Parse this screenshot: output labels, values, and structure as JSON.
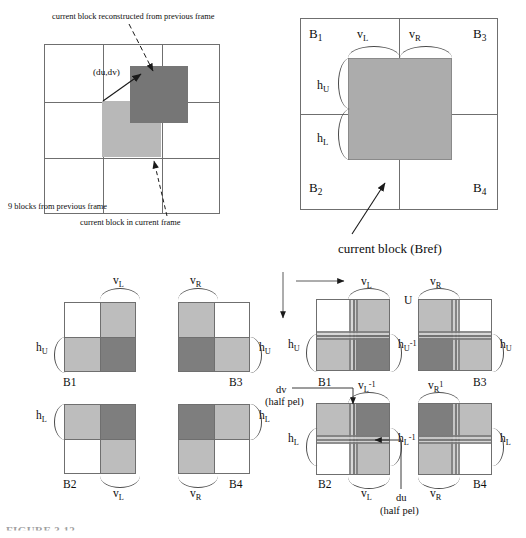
{
  "figure": {
    "caption": "FIGURE 3.12",
    "colors": {
      "dark_gray": "#767676",
      "light_gray": "#b8b8b8",
      "mid_gray": "#acacac",
      "line": "#6f6f6f",
      "text": "#0d0d0d"
    }
  },
  "panel_a": {
    "name": "previous-frame-grid",
    "title_top": "current block reconstructed from previous frame",
    "motion_vector_label": "(du,dv)",
    "note_left": "9 blocks from previous frame",
    "note_bottom": "current block in current frame",
    "grid_rows": 3,
    "grid_cols": 3
  },
  "panel_b": {
    "name": "current-block-bref",
    "caption": "current block (Bref)",
    "corner_labels": [
      {
        "base": "B",
        "sub": "1",
        "pos": "top-left"
      },
      {
        "base": "B",
        "sub": "3",
        "pos": "top-right"
      },
      {
        "base": "B",
        "sub": "2",
        "pos": "bottom-left"
      },
      {
        "base": "B",
        "sub": "4",
        "pos": "bottom-right"
      }
    ],
    "edge_labels": [
      {
        "base": "v",
        "sub": "L",
        "pos": "top-left"
      },
      {
        "base": "v",
        "sub": "R",
        "pos": "top-right"
      },
      {
        "base": "h",
        "sub": "U",
        "pos": "left-upper"
      },
      {
        "base": "h",
        "sub": "L",
        "pos": "left-lower"
      }
    ]
  },
  "panel_c": {
    "name": "four-neighbour-weight-blocks",
    "blocks": [
      {
        "id": "B1",
        "label": "B1",
        "quads": [
          "white",
          "light",
          "light",
          "dark"
        ]
      },
      {
        "id": "B3",
        "label": "B3",
        "quads": [
          "light",
          "white",
          "dark",
          "light"
        ]
      },
      {
        "id": "B2",
        "label": "B2",
        "quads": [
          "light",
          "dark",
          "white",
          "light"
        ]
      },
      {
        "id": "B4",
        "label": "B4",
        "quads": [
          "dark",
          "light",
          "light",
          "white"
        ]
      }
    ],
    "labels": [
      {
        "base": "v",
        "sub": "L",
        "pos": "above-B1"
      },
      {
        "base": "v",
        "sub": "R",
        "pos": "above-B3"
      },
      {
        "base": "h",
        "sub": "U",
        "pos": "right-B3"
      },
      {
        "base": "h",
        "sub": "U",
        "pos": "left-B1"
      },
      {
        "base": "h",
        "sub": "L",
        "pos": "left-B2"
      },
      {
        "base": "h",
        "sub": "L",
        "pos": "right-B4"
      },
      {
        "base": "v",
        "sub": "L",
        "pos": "below-B2"
      },
      {
        "base": "v",
        "sub": "R",
        "pos": "below-B4"
      }
    ]
  },
  "panel_d": {
    "name": "half-pel-interpolated-blocks",
    "blocks": [
      {
        "id": "B1",
        "label": "B1"
      },
      {
        "id": "B3",
        "label": "B3"
      },
      {
        "id": "B2",
        "label": "B2"
      },
      {
        "id": "B4",
        "label": "B4"
      }
    ],
    "u_label": "U",
    "dv_label": "dv",
    "dv_unit": "(half pel)",
    "du_label": "du",
    "du_unit": "(half pel)",
    "labels": [
      {
        "base": "v",
        "sub": "L",
        "sup": "",
        "pos": "above-B1"
      },
      {
        "base": "v",
        "sub": "R",
        "sup": "",
        "pos": "above-B3"
      },
      {
        "base": "h",
        "sub": "U",
        "sup": "",
        "pos": "left-B1"
      },
      {
        "base": "h",
        "sub": "U",
        "sup": "-1",
        "pos": "right-B1"
      },
      {
        "base": "h",
        "sub": "U",
        "sup": "",
        "pos": "right-B3"
      },
      {
        "base": "v",
        "sub": "L",
        "sup": "-1",
        "pos": "above-B2"
      },
      {
        "base": "v",
        "sub": "R",
        "sup": "1",
        "pos": "above-B4"
      },
      {
        "base": "h",
        "sub": "L",
        "sup": "",
        "pos": "left-B2"
      },
      {
        "base": "h",
        "sub": "L",
        "sup": "-1",
        "pos": "right-B2"
      },
      {
        "base": "h",
        "sub": "L",
        "sup": "",
        "pos": "right-B4"
      },
      {
        "base": "v",
        "sub": "L",
        "sup": "",
        "pos": "below-B2"
      },
      {
        "base": "v",
        "sub": "R",
        "sup": "",
        "pos": "below-B4"
      }
    ]
  }
}
